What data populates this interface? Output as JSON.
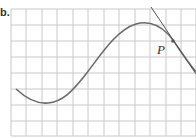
{
  "figure": {
    "label": "b.",
    "point_label": "P",
    "grid": {
      "x_lines": [
        11,
        26,
        42,
        57,
        73,
        88,
        104,
        119,
        135,
        150,
        166,
        181,
        196
      ],
      "y_lines": [
        9,
        25,
        41,
        57,
        73,
        89,
        105,
        121,
        136
      ],
      "color": "#c8c8c8"
    },
    "curve": {
      "color": "#6a6a6a",
      "path": "M16,89 C28,100 38,104 48,103 C62,102 72,92 86,74 C100,56 116,30 136,24 C150,20 160,26 168,34 C174,40 180,52 196,72"
    },
    "tangent": {
      "color": "#555555",
      "x1": 151,
      "y1": 7,
      "x2": 196,
      "y2": 74
    },
    "point": {
      "x": 173,
      "y": 41,
      "color": "#555555"
    }
  }
}
